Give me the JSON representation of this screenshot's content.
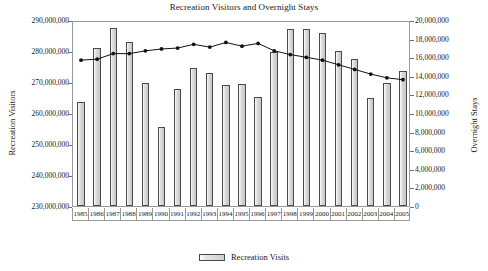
{
  "chart_data": {
    "type": "bar",
    "title": "Recreation Visitors and Overnight Stays",
    "xlabel": "",
    "ylabel": "Recreation Visitors",
    "y2label": "Overnight Stays",
    "grid": false,
    "legend_position": "bottom",
    "categories": [
      "1985",
      "1986",
      "1987",
      "1988",
      "1989",
      "1990",
      "1991",
      "1992",
      "1993",
      "1994",
      "1995",
      "1996",
      "1997",
      "1998",
      "1999",
      "2000",
      "2001",
      "2002",
      "2003",
      "2004",
      "2005"
    ],
    "ylim": [
      230000000,
      290000000
    ],
    "y2lim": [
      0,
      20000000
    ],
    "yticks": [
      "230,000,000",
      "240,000,000",
      "250,000,000",
      "260,000,000",
      "270,000,000",
      "280,000,000",
      "290,000,000"
    ],
    "y2ticks": [
      "0",
      "2,000,000",
      "4,000,000",
      "6,000,000",
      "8,000,000",
      "10,000,000",
      "12,000,000",
      "14,000,000",
      "16,000,000",
      "18,000,000",
      "20,000,000"
    ],
    "series": [
      {
        "name": "Recreation Visits",
        "type": "bar",
        "axis": "left",
        "values": [
          263700000,
          281000000,
          287400000,
          282800000,
          269600000,
          255500000,
          267800000,
          274500000,
          273000000,
          268900000,
          269300000,
          265200000,
          279600000,
          287200000,
          287000000,
          285800000,
          279900000,
          277300000,
          265000000,
          269700000,
          273500000
        ]
      },
      {
        "name": "Overnight Stays",
        "type": "line",
        "axis": "right",
        "values": [
          15900000,
          16000000,
          16600000,
          16600000,
          16900000,
          17100000,
          17200000,
          17600000,
          17300000,
          17800000,
          17400000,
          17700000,
          16900000,
          16500000,
          16200000,
          15900000,
          15400000,
          14900000,
          14400000,
          14000000,
          13800000
        ]
      }
    ]
  },
  "legend": {
    "items": [
      {
        "label": "Recreation Visits",
        "swatch": "bar-swatch"
      }
    ]
  }
}
